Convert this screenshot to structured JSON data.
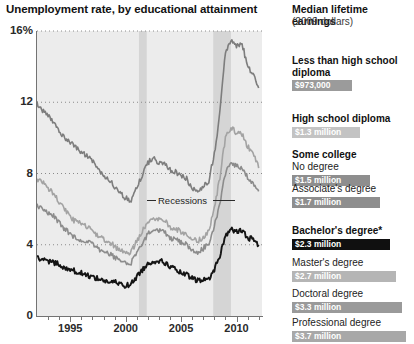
{
  "chart_data": {
    "type": "line",
    "title": "Unemployment rate, by educational attainment",
    "xlabel": "",
    "ylabel": "",
    "ylim": [
      0,
      16
    ],
    "xlim": [
      1992.0,
      2012.3
    ],
    "grid": true,
    "legend_position": "none",
    "y_ticks": [
      "0",
      "4",
      "8",
      "12",
      "16%"
    ],
    "y_tick_values": [
      0,
      4,
      8,
      12,
      16
    ],
    "x_ticks": [
      "1995",
      "2000",
      "2005",
      "2010"
    ],
    "x_tick_values": [
      1995,
      2000,
      2005,
      2010
    ],
    "annotations": [
      {
        "text": "Recessions",
        "x": 2002.6,
        "y": 6.0
      }
    ],
    "shaded_regions": [
      {
        "label": "Recession",
        "x0": 2001.2,
        "x1": 2001.9
      },
      {
        "label": "Recession",
        "x0": 2007.9,
        "x1": 2009.5
      }
    ],
    "series": [
      {
        "name": "Less than high school diploma",
        "color": "#7d7d7d",
        "x": [
          1992.0,
          1992.5,
          1993.0,
          1993.5,
          1994.0,
          1994.5,
          1995.0,
          1995.5,
          1996.0,
          1996.5,
          1997.0,
          1997.5,
          1998.0,
          1998.5,
          1999.0,
          1999.5,
          2000.0,
          2000.5,
          2001.0,
          2001.5,
          2002.0,
          2002.5,
          2003.0,
          2003.5,
          2004.0,
          2004.5,
          2005.0,
          2005.5,
          2006.0,
          2006.5,
          2007.0,
          2007.5,
          2008.0,
          2008.5,
          2009.0,
          2009.5,
          2010.0,
          2010.5,
          2011.0,
          2011.5,
          2012.0
        ],
        "values": [
          11.9,
          11.5,
          11.2,
          10.9,
          10.4,
          10.0,
          9.8,
          9.5,
          9.2,
          9.0,
          8.7,
          8.3,
          7.9,
          7.7,
          7.2,
          6.9,
          6.6,
          6.5,
          7.3,
          7.9,
          8.6,
          8.9,
          8.6,
          8.6,
          8.2,
          8.1,
          7.9,
          7.7,
          7.1,
          7.0,
          7.3,
          7.6,
          9.1,
          11.4,
          14.8,
          15.5,
          15.1,
          15.3,
          14.0,
          13.5,
          12.8
        ],
        "linewidth": 1.6
      },
      {
        "name": "High school diploma",
        "color": "#a3a3a3",
        "x": [
          1992.0,
          1992.5,
          1993.0,
          1993.5,
          1994.0,
          1994.5,
          1995.0,
          1995.5,
          1996.0,
          1996.5,
          1997.0,
          1997.5,
          1998.0,
          1998.5,
          1999.0,
          1999.5,
          2000.0,
          2000.5,
          2001.0,
          2001.5,
          2002.0,
          2002.5,
          2003.0,
          2003.5,
          2004.0,
          2004.5,
          2005.0,
          2005.5,
          2006.0,
          2006.5,
          2007.0,
          2007.5,
          2008.0,
          2008.5,
          2009.0,
          2009.5,
          2010.0,
          2010.5,
          2011.0,
          2011.5,
          2012.0
        ],
        "values": [
          7.7,
          7.5,
          7.2,
          6.9,
          6.4,
          6.0,
          5.5,
          5.3,
          5.2,
          5.0,
          4.8,
          4.5,
          4.3,
          4.2,
          3.9,
          3.7,
          3.5,
          3.6,
          4.2,
          4.8,
          5.3,
          5.5,
          5.5,
          5.4,
          5.0,
          4.9,
          4.7,
          4.6,
          4.3,
          4.2,
          4.4,
          4.8,
          6.0,
          7.8,
          10.0,
          10.6,
          10.3,
          10.2,
          9.5,
          9.2,
          8.3
        ],
        "linewidth": 1.6
      },
      {
        "name": "Some college / associate's",
        "color": "#8c8c8c",
        "x": [
          1992.0,
          1992.5,
          1993.0,
          1993.5,
          1994.0,
          1994.5,
          1995.0,
          1995.5,
          1996.0,
          1996.5,
          1997.0,
          1997.5,
          1998.0,
          1998.5,
          1999.0,
          1999.5,
          2000.0,
          2000.5,
          2001.0,
          2001.5,
          2002.0,
          2002.5,
          2003.0,
          2003.5,
          2004.0,
          2004.5,
          2005.0,
          2005.5,
          2006.0,
          2006.5,
          2007.0,
          2007.5,
          2008.0,
          2008.5,
          2009.0,
          2009.5,
          2010.0,
          2010.5,
          2011.0,
          2011.5,
          2012.0
        ],
        "values": [
          6.2,
          6.0,
          5.8,
          5.6,
          5.2,
          4.9,
          4.6,
          4.4,
          4.3,
          4.2,
          4.0,
          3.8,
          3.6,
          3.5,
          3.3,
          3.1,
          2.9,
          3.0,
          3.5,
          4.1,
          4.6,
          4.8,
          4.8,
          4.7,
          4.4,
          4.3,
          4.1,
          4.0,
          3.7,
          3.6,
          3.8,
          4.1,
          5.0,
          6.4,
          8.0,
          8.6,
          8.4,
          8.3,
          7.8,
          7.5,
          7.0
        ],
        "linewidth": 1.6
      },
      {
        "name": "Bachelor's degree or higher",
        "color": "#141414",
        "x": [
          1992.0,
          1992.5,
          1993.0,
          1993.5,
          1994.0,
          1994.5,
          1995.0,
          1995.5,
          1996.0,
          1996.5,
          1997.0,
          1997.5,
          1998.0,
          1998.5,
          1999.0,
          1999.5,
          2000.0,
          2000.5,
          2001.0,
          2001.5,
          2002.0,
          2002.5,
          2003.0,
          2003.5,
          2004.0,
          2004.5,
          2005.0,
          2005.5,
          2006.0,
          2006.5,
          2007.0,
          2007.5,
          2008.0,
          2008.5,
          2009.0,
          2009.5,
          2010.0,
          2010.5,
          2011.0,
          2011.5,
          2012.0
        ],
        "values": [
          3.2,
          3.3,
          3.1,
          3.0,
          2.9,
          2.7,
          2.6,
          2.5,
          2.4,
          2.3,
          2.2,
          2.1,
          2.0,
          1.9,
          1.9,
          1.8,
          1.7,
          1.8,
          2.2,
          2.6,
          2.9,
          3.1,
          3.1,
          3.0,
          2.8,
          2.6,
          2.4,
          2.3,
          2.1,
          2.0,
          2.0,
          2.1,
          2.6,
          3.4,
          4.5,
          4.9,
          4.7,
          4.8,
          4.4,
          4.3,
          4.0
        ],
        "linewidth": 1.9
      }
    ]
  },
  "chart": {
    "title": "Unemployment rate, by educational attainment",
    "recessions_label": "Recessions"
  },
  "panel": {
    "title": "Median lifetime earnings",
    "subtitle": "(2009 dollars)",
    "items": [
      {
        "head": "Less than high school",
        "head2": "diploma",
        "sub": "",
        "value": "$973,000",
        "bar_color": "#9b9b9b",
        "bar_width": 60,
        "bold_head": true
      },
      {
        "head": "High school diploma",
        "head2": "",
        "sub": "",
        "value": "$1.3 million",
        "bar_color": "#c3c3c3",
        "bar_width": 68,
        "bold_head": true
      },
      {
        "head": "Some college",
        "head2": "",
        "sub": "No degree",
        "value": "$1.5 million",
        "bar_color": "#8e8e8e",
        "bar_width": 78,
        "bold_head": true
      },
      {
        "head": "",
        "head2": "",
        "sub": "Associate's degree",
        "value": "$1.7 million",
        "bar_color": "#8e8e8e",
        "bar_width": 88,
        "bold_head": false
      },
      {
        "head": "Bachelor's degree*",
        "head2": "",
        "sub": "",
        "value": "$2.3 million",
        "bar_color": "#101010",
        "bar_width": 98,
        "bold_head": true
      },
      {
        "head": "",
        "head2": "",
        "sub": "Master's degree",
        "value": "$2.7 million",
        "bar_color": "#b5b5b5",
        "bar_width": 104,
        "bold_head": false
      },
      {
        "head": "",
        "head2": "",
        "sub": "Doctoral degree",
        "value": "$3.3 million",
        "bar_color": "#9a9a9a",
        "bar_width": 110,
        "bold_head": false
      },
      {
        "head": "",
        "head2": "",
        "sub": "Professional degree",
        "value": "$3.7 million",
        "bar_color": "#a8a8a8",
        "bar_width": 114,
        "bold_head": false
      }
    ]
  }
}
